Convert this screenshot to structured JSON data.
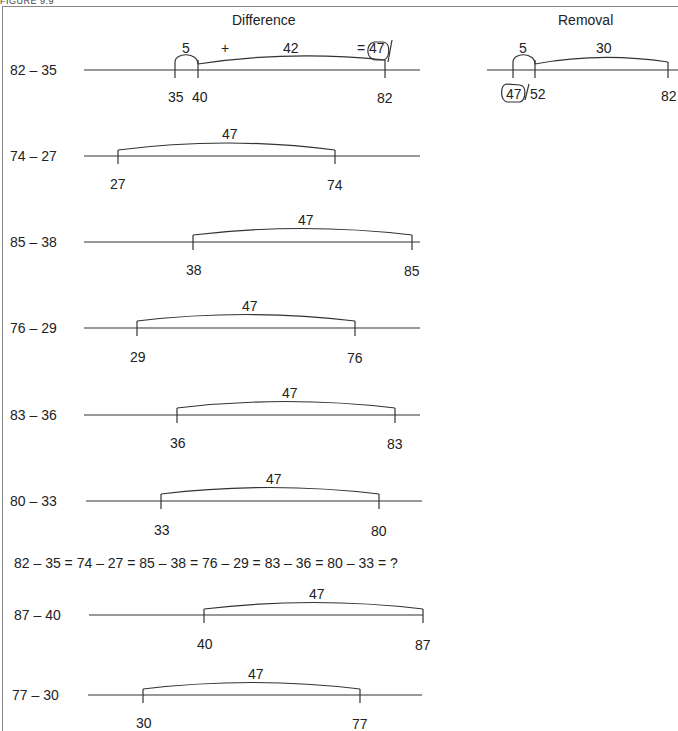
{
  "figure": {
    "caption": "FIGURE 9.9",
    "headings": {
      "left": "Difference",
      "right": "Removal"
    }
  },
  "difference_top": {
    "label": "82 – 35",
    "jumps": [
      {
        "label": "5"
      },
      {
        "label": "+"
      },
      {
        "label": "42"
      },
      {
        "label": "= 47"
      }
    ],
    "ticks": [
      "35",
      "40",
      "82"
    ]
  },
  "removal_top": {
    "jumps": [
      {
        "label": "5"
      },
      {
        "label": "30"
      }
    ],
    "ticks": [
      "47",
      "52",
      "82"
    ]
  },
  "rows": [
    {
      "label": "74 – 27",
      "jump": "47",
      "start": "27",
      "end": "74"
    },
    {
      "label": "85 – 38",
      "jump": "47",
      "start": "38",
      "end": "85"
    },
    {
      "label": "76 – 29",
      "jump": "47",
      "start": "29",
      "end": "76"
    },
    {
      "label": "83 – 36",
      "jump": "47",
      "start": "36",
      "end": "83"
    },
    {
      "label": "80 – 33",
      "jump": "47",
      "start": "33",
      "end": "80"
    },
    {
      "label": "87 – 40",
      "jump": "47",
      "start": "40",
      "end": "87"
    },
    {
      "label": "77 – 30",
      "jump": "47",
      "start": "30",
      "end": "77"
    }
  ],
  "equation": "82 – 35 = 74 – 27 = 85 – 38 = 76 – 29 = 83 – 36 = 80 – 33 = ?"
}
